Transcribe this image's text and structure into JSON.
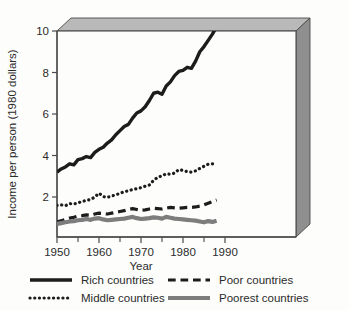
{
  "figure": {
    "frame_style": "3d-slab",
    "frame_face_color": "#fdfdfc",
    "frame_top_color": "#b9b9b9",
    "frame_side_color": "#8f8f8f",
    "frame_edge_color": "#4a4a4a",
    "background": "#ffffff"
  },
  "axes": {
    "y_label": "Income per person (1980 dollars)",
    "x_label": "Year",
    "y_ticks": [
      "2",
      "4",
      "6",
      "8",
      "10"
    ],
    "y_tick_values": [
      2,
      4,
      6,
      8,
      10
    ],
    "x_ticks": [
      "1950",
      "1960",
      "1970",
      "1980",
      "1990"
    ],
    "x_tick_values": [
      1950,
      1960,
      1970,
      1980,
      1990
    ],
    "x_minor_values": [
      1955,
      1965,
      1975,
      1985
    ],
    "xlim": [
      1948,
      1992
    ],
    "ylim": [
      0,
      10.8
    ],
    "grid": "none",
    "tick_color": "#4a4a4a",
    "label_color": "#2b2b2b"
  },
  "legend": {
    "position": "below-axes",
    "columns": 2,
    "entries": [
      {
        "label": "Rich countries",
        "style": "solid",
        "color": "#1c1c1c",
        "width": 3.4,
        "col": 0,
        "row": 0
      },
      {
        "label": "Poor countries",
        "style": "dashed",
        "color": "#1c1c1c",
        "width": 3.2,
        "col": 1,
        "row": 0
      },
      {
        "label": "Middle countries",
        "style": "dotted",
        "color": "#1c1c1c",
        "width": 3.2,
        "col": 0,
        "row": 1
      },
      {
        "label": "Poorest countries",
        "style": "solid",
        "color": "#7d7d7d",
        "width": 4.2,
        "col": 1,
        "row": 1
      }
    ]
  },
  "chart_data": {
    "type": "line",
    "title": "",
    "xlabel": "Year",
    "ylabel": "Income per person (1980 dollars)",
    "xlim": [
      1948,
      1992
    ],
    "ylim": [
      0,
      10.8
    ],
    "x": [
      1950,
      1951,
      1952,
      1953,
      1954,
      1955,
      1956,
      1957,
      1958,
      1959,
      1960,
      1961,
      1962,
      1963,
      1964,
      1965,
      1966,
      1967,
      1968,
      1969,
      1970,
      1971,
      1972,
      1973,
      1974,
      1975,
      1976,
      1977,
      1978,
      1979,
      1980,
      1981,
      1982,
      1983,
      1984,
      1985,
      1986,
      1987,
      1988
    ],
    "series": [
      {
        "name": "Rich countries",
        "style": "solid",
        "color": "#1c1c1c",
        "width": 3.4,
        "values": [
          3.2,
          3.35,
          3.45,
          3.6,
          3.55,
          3.8,
          3.85,
          3.95,
          3.9,
          4.15,
          4.3,
          4.4,
          4.6,
          4.75,
          5.0,
          5.2,
          5.4,
          5.5,
          5.8,
          6.05,
          6.15,
          6.35,
          6.65,
          7.0,
          7.05,
          6.95,
          7.35,
          7.55,
          7.85,
          8.05,
          8.1,
          8.25,
          8.2,
          8.55,
          9.0,
          9.25,
          9.55,
          9.85,
          10.2
        ]
      },
      {
        "name": "Middle countries",
        "style": "dotted",
        "color": "#1c1c1c",
        "width": 3.2,
        "values": [
          1.6,
          1.62,
          1.58,
          1.68,
          1.66,
          1.72,
          1.78,
          1.84,
          1.88,
          2.0,
          2.18,
          2.02,
          1.98,
          2.05,
          2.1,
          2.18,
          2.25,
          2.3,
          2.36,
          2.4,
          2.45,
          2.52,
          2.58,
          2.8,
          2.95,
          3.02,
          3.12,
          3.1,
          3.15,
          3.32,
          3.28,
          3.22,
          3.2,
          3.26,
          3.38,
          3.48,
          3.58,
          3.6,
          3.62
        ]
      },
      {
        "name": "Poor countries",
        "style": "dashed",
        "color": "#1c1c1c",
        "width": 3.2,
        "values": [
          0.8,
          0.86,
          0.92,
          0.98,
          1.02,
          1.08,
          1.1,
          1.14,
          1.12,
          1.18,
          1.22,
          1.2,
          1.18,
          1.22,
          1.26,
          1.3,
          1.34,
          1.4,
          1.44,
          1.4,
          1.36,
          1.38,
          1.42,
          1.46,
          1.44,
          1.42,
          1.46,
          1.5,
          1.48,
          1.46,
          1.48,
          1.5,
          1.5,
          1.52,
          1.56,
          1.62,
          1.7,
          1.78,
          1.85
        ]
      },
      {
        "name": "Poorest countries",
        "style": "solid",
        "color": "#7d7d7d",
        "width": 4.2,
        "values": [
          0.7,
          0.74,
          0.78,
          0.82,
          0.84,
          0.88,
          0.9,
          0.94,
          0.9,
          0.96,
          0.98,
          0.92,
          0.88,
          0.9,
          0.92,
          0.94,
          0.96,
          1.0,
          1.04,
          0.98,
          0.94,
          0.96,
          0.98,
          1.02,
          1.0,
          0.96,
          1.04,
          1.0,
          0.96,
          0.94,
          0.92,
          0.9,
          0.88,
          0.86,
          0.82,
          0.78,
          0.84,
          0.8,
          0.86
        ]
      }
    ]
  }
}
